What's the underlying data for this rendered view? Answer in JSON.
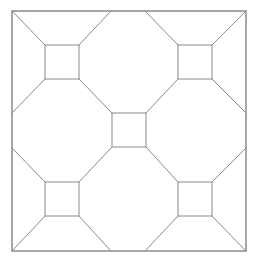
{
  "diagram": {
    "type": "geometric-tiling",
    "stroke_color": "#8a8a8a",
    "outer_stroke_color": "#6e6e6e",
    "background": "#ffffff",
    "outer_square": {
      "x1": 12,
      "y1": 11,
      "x2": 246,
      "y2": 251
    },
    "squares": [
      {
        "name": "top-left",
        "x1": 45,
        "y1": 45,
        "x2": 79,
        "y2": 79
      },
      {
        "name": "top-right",
        "x1": 178,
        "y1": 45,
        "x2": 212,
        "y2": 79
      },
      {
        "name": "center",
        "x1": 112,
        "y1": 113,
        "x2": 146,
        "y2": 147
      },
      {
        "name": "bottom-left",
        "x1": 45,
        "y1": 182,
        "x2": 79,
        "y2": 216
      },
      {
        "name": "bottom-right",
        "x1": 178,
        "y1": 182,
        "x2": 212,
        "y2": 216
      }
    ],
    "connectors": [
      [
        12,
        11,
        45,
        45
      ],
      [
        111,
        11,
        79,
        45
      ],
      [
        12,
        113,
        45,
        79
      ],
      [
        79,
        79,
        112,
        113
      ],
      [
        145,
        11,
        178,
        45
      ],
      [
        246,
        11,
        212,
        45
      ],
      [
        212,
        79,
        246,
        113
      ],
      [
        178,
        79,
        146,
        113
      ],
      [
        12,
        148,
        45,
        182
      ],
      [
        112,
        147,
        79,
        182
      ],
      [
        45,
        216,
        12,
        251
      ],
      [
        79,
        216,
        111,
        251
      ],
      [
        146,
        147,
        178,
        182
      ],
      [
        246,
        148,
        212,
        182
      ],
      [
        178,
        216,
        145,
        251
      ],
      [
        212,
        216,
        246,
        251
      ]
    ]
  }
}
